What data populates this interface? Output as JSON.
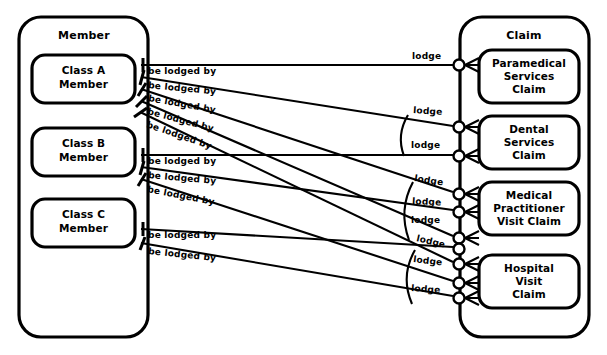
{
  "diagram": {
    "type": "entity-relationship-diagram",
    "notation": "crows-foot-subtype",
    "background_color": "#ffffff",
    "line_color": "#000000"
  },
  "entities": {
    "left": {
      "name": "Member",
      "subtypes": [
        {
          "id": "class-a-member",
          "line1": "Class A",
          "line2": "Member"
        },
        {
          "id": "class-b-member",
          "line1": "Class B",
          "line2": "Member"
        },
        {
          "id": "class-c-member",
          "line1": "Class C",
          "line2": "Member"
        }
      ]
    },
    "right": {
      "name": "Claim",
      "subtypes": [
        {
          "id": "paramedical-services-claim",
          "line1": "Paramedical",
          "line2": "Services",
          "line3": "Claim"
        },
        {
          "id": "dental-services-claim",
          "line1": "Dental",
          "line2": "Services",
          "line3": "Claim"
        },
        {
          "id": "medical-practitioner-visit-claim",
          "line1": "Medical",
          "line2": "Practitioner",
          "line3": "Visit Claim"
        },
        {
          "id": "hospital-visit-claim",
          "line1": "Hospital",
          "line2": "Visit",
          "line3": "Claim"
        }
      ]
    }
  },
  "relationship_labels": {
    "left_verb": "be lodged by",
    "right_verb": "lodge"
  },
  "relationships": [
    {
      "id": "r1",
      "from": "class-a-member",
      "to": "paramedical-services-claim",
      "left_label": "be lodged by",
      "right_label": "lodge"
    },
    {
      "id": "r2",
      "from": "class-a-member",
      "to": "dental-services-claim",
      "left_label": "be lodged by",
      "right_label": "lodge"
    },
    {
      "id": "r3",
      "from": "class-a-member",
      "to": "medical-practitioner-visit-claim",
      "left_label": "be lodged by",
      "right_label": "lodge"
    },
    {
      "id": "r4",
      "from": "class-a-member",
      "to": "medical-practitioner-visit-claim",
      "left_label": "be lodged by",
      "right_label": "lodge"
    },
    {
      "id": "r5",
      "from": "class-a-member",
      "to": "hospital-visit-claim",
      "left_label": "be lodged by",
      "right_label": "lodge"
    },
    {
      "id": "r6",
      "from": "class-b-member",
      "to": "dental-services-claim",
      "left_label": "be lodged by",
      "right_label": "lodge"
    },
    {
      "id": "r7",
      "from": "class-b-member",
      "to": "medical-practitioner-visit-claim",
      "left_label": "be lodged by",
      "right_label": "lodge"
    },
    {
      "id": "r8",
      "from": "class-b-member",
      "to": "hospital-visit-claim",
      "left_label": "be lodged by",
      "right_label": "lodge"
    },
    {
      "id": "r9",
      "from": "class-c-member",
      "to": "hospital-visit-claim",
      "left_label": "be lodged by",
      "right_label": "lodge"
    },
    {
      "id": "r10",
      "from": "class-c-member",
      "to": "hospital-visit-claim",
      "left_label": "be lodged by",
      "right_label": "lodge"
    }
  ],
  "left_labels": [
    "be lodged by",
    "be lodged by",
    "be lodged by",
    "be lodged by",
    "be lodged by",
    "be lodged by",
    "be lodged by",
    "be lodged by",
    "be lodged by",
    "be lodged by"
  ],
  "right_labels": [
    "lodge",
    "lodge",
    "lodge",
    "lodge",
    "lodge",
    "lodge",
    "lodge",
    "lodge",
    "lodge"
  ]
}
